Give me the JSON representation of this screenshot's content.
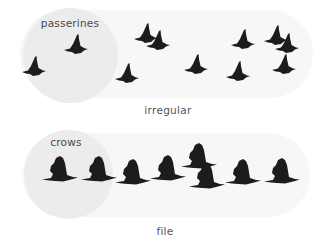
{
  "colors": {
    "capsule": "#f7f7f7",
    "circle": "#ececec",
    "bird": "#1c1c1c",
    "text": "#4a4a4a"
  },
  "panels": [
    {
      "id": "irregular",
      "group_label": "passerines",
      "caption": "irregular",
      "bird_type": "passerine-icon",
      "birds": [
        {
          "x": 34,
          "y": 68,
          "s": 1.0
        },
        {
          "x": 76,
          "y": 46,
          "s": 1.0
        },
        {
          "x": 127,
          "y": 75,
          "s": 1.0
        },
        {
          "x": 146,
          "y": 35,
          "s": 1.0
        },
        {
          "x": 158,
          "y": 42,
          "s": 1.0
        },
        {
          "x": 196,
          "y": 66,
          "s": 1.0
        },
        {
          "x": 238,
          "y": 73,
          "s": 1.0
        },
        {
          "x": 243,
          "y": 41,
          "s": 1.0
        },
        {
          "x": 276,
          "y": 37,
          "s": 1.0
        },
        {
          "x": 287,
          "y": 45,
          "s": 1.0
        },
        {
          "x": 284,
          "y": 66,
          "s": 1.0
        }
      ]
    },
    {
      "id": "file",
      "group_label": "crows",
      "caption": "file",
      "bird_type": "crow-icon",
      "birds": [
        {
          "x": 60,
          "y": 173
        },
        {
          "x": 99,
          "y": 173
        },
        {
          "x": 133,
          "y": 176
        },
        {
          "x": 168,
          "y": 172
        },
        {
          "x": 199,
          "y": 160
        },
        {
          "x": 207,
          "y": 180
        },
        {
          "x": 243,
          "y": 176
        },
        {
          "x": 282,
          "y": 175
        }
      ]
    }
  ]
}
